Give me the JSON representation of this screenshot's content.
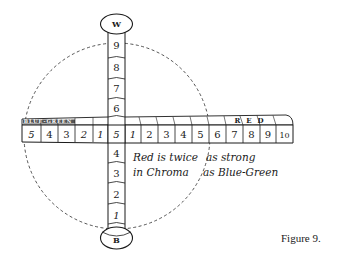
{
  "figure": {
    "caption": "Figure 9.",
    "colors": {
      "ink": "#1a1a1a",
      "background": "#ffffff"
    }
  },
  "vertical_axis": {
    "top_cap": "W",
    "bottom_cap": "B",
    "upper_steps": [
      "9",
      "8",
      "7",
      "6"
    ],
    "center": "5",
    "lower_steps": [
      "4",
      "3",
      "2",
      "1"
    ]
  },
  "horizontal_axis": {
    "left_label": "BLUE-GREEN",
    "right_label": "RED",
    "left_steps": [
      "5",
      "4",
      "3",
      "2",
      "1"
    ],
    "right_steps": [
      "1",
      "2",
      "3",
      "4",
      "5",
      "6",
      "7",
      "8",
      "9",
      "10"
    ]
  },
  "annotation": {
    "line1_left": "Red is twice",
    "line1_right": "as strong",
    "line2_left": "in Chroma",
    "line2_right": "as Blue-Green"
  }
}
